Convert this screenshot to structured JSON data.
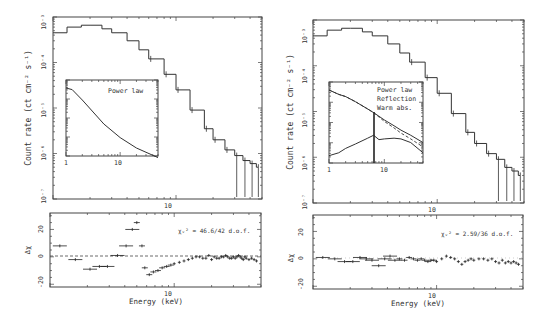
{
  "chart_data": [
    {
      "panel": "left",
      "type": "line",
      "subtype": "step-spectrum",
      "title": "",
      "xlabel": "Energy (keV)",
      "ylabel": "Count rate (ct cm^-2 s^-1)",
      "xscale": "log",
      "yscale": "log",
      "xlim": [
        1,
        50
      ],
      "ylim": [
        1e-07,
        0.001
      ],
      "x_ticks": [
        "10"
      ],
      "y_ticks": [
        "10^-7",
        "10^-6",
        "10^-5",
        "10^-4",
        "10^-3"
      ],
      "series": [
        {
          "name": "Data + model",
          "x": [
            1.0,
            1.3,
            1.7,
            2.0,
            2.5,
            3.0,
            4.0,
            5.0,
            6.0,
            8.0,
            10,
            13,
            17,
            20,
            25,
            30,
            35,
            40,
            45
          ],
          "y": [
            0.00045,
            0.0006,
            0.00066,
            0.00066,
            0.00055,
            0.00045,
            0.0003,
            0.00019,
            0.00012,
            5.5e-05,
            2.5e-05,
            9e-06,
            3.5e-06,
            2e-06,
            1.2e-06,
            9e-07,
            7e-07,
            6e-07,
            5e-07
          ]
        }
      ],
      "inset": {
        "label": "Power law",
        "xlim": [
          1,
          50
        ],
        "x_ticks": [
          "1",
          "10"
        ],
        "series": [
          {
            "name": "Power law",
            "x": [
              1,
              1.3,
              2,
              5,
              10,
              20,
              50
            ],
            "y": [
              1.0,
              0.98,
              0.85,
              0.55,
              0.38,
              0.25,
              0.13
            ]
          }
        ]
      },
      "residuals": {
        "ylabel": "Δχ",
        "ylim": [
          -22,
          32
        ],
        "y_ticks": [
          "-20",
          "0",
          "20"
        ],
        "x_ticks": [
          "10"
        ],
        "annotation": "χ_ν² = 46.6/42 d.o.f.",
        "x": [
          1.2,
          1.6,
          2.1,
          2.5,
          2.9,
          3.5,
          4.1,
          4.6,
          5.0,
          5.5,
          5.8,
          6.3,
          6.8,
          7.4,
          8.0,
          8.7,
          9.4,
          10,
          11,
          12,
          13,
          14,
          15,
          16,
          17,
          18,
          19,
          20,
          21,
          22,
          23,
          24,
          25,
          26,
          27,
          28,
          29,
          30,
          31,
          32,
          33,
          34,
          35,
          36,
          37,
          38,
          40,
          42,
          44,
          46
        ],
        "values": [
          8,
          -2,
          -9,
          -7,
          -7,
          1,
          8,
          20,
          25,
          8,
          -8,
          -13,
          -11,
          -10,
          -8,
          -7,
          -6,
          -5,
          -4,
          -3,
          -2,
          -1,
          0,
          0,
          -1,
          -1,
          1,
          -2,
          0,
          -1,
          -1,
          0,
          0,
          1,
          0,
          -1,
          -1,
          0,
          -1,
          0,
          1,
          0,
          -1,
          -2,
          0,
          -1,
          -2,
          -1,
          -2,
          -3
        ]
      }
    },
    {
      "panel": "right",
      "type": "line",
      "subtype": "step-spectrum",
      "title": "",
      "xlabel": "Energy (keV)",
      "ylabel": "Count rate (ct cm^-2 s^-1)",
      "xscale": "log",
      "yscale": "log",
      "xlim": [
        1,
        50
      ],
      "ylim": [
        1e-07,
        0.001
      ],
      "x_ticks": [
        "10"
      ],
      "y_ticks": [
        "10^-7",
        "10^-6",
        "10^-5",
        "10^-4",
        "10^-3"
      ],
      "series": [
        {
          "name": "Data + model",
          "x": [
            1.0,
            1.3,
            1.7,
            2.0,
            2.5,
            3.0,
            4.0,
            5.0,
            6.0,
            8.0,
            10,
            13,
            17,
            20,
            25,
            30,
            35,
            40,
            45
          ],
          "y": [
            0.00045,
            0.0006,
            0.00066,
            0.00066,
            0.00055,
            0.00045,
            0.0003,
            0.00019,
            0.00012,
            5.5e-05,
            2.5e-05,
            9e-06,
            3.5e-06,
            2e-06,
            1.2e-06,
            9e-07,
            6e-07,
            5e-07,
            4e-07
          ]
        }
      ],
      "inset": {
        "labels": [
          "Power law",
          "Reflection",
          "Warm abs."
        ],
        "xlim": [
          1,
          50
        ],
        "x_ticks": [
          "1",
          "10"
        ],
        "series": [
          {
            "name": "Power law",
            "style": "solid"
          },
          {
            "name": "Reflection",
            "style": "solid, with Fe line at ~6.4 keV"
          },
          {
            "name": "Warm abs.",
            "style": "dashed"
          }
        ]
      },
      "residuals": {
        "ylabel": "Δχ",
        "ylim": [
          -22,
          32
        ],
        "y_ticks": [
          "-20",
          "0",
          "20"
        ],
        "x_ticks": [
          "10"
        ],
        "annotation": "χ_ν² = 2.59/36 d.o.f.",
        "x": [
          1.2,
          1.5,
          1.8,
          2.1,
          2.4,
          2.7,
          3.0,
          3.4,
          3.8,
          4.2,
          4.6,
          5.0,
          5.5,
          6.0,
          6.5,
          7.0,
          7.5,
          8.0,
          8.5,
          9.0,
          9.5,
          10,
          11,
          12,
          13,
          14,
          15,
          16,
          17,
          18,
          19,
          20,
          22,
          24,
          26,
          28,
          30,
          32,
          34,
          36,
          38,
          40,
          42,
          44,
          46
        ],
        "values": [
          1,
          0,
          -2,
          -2,
          1,
          0,
          -1,
          -5,
          0,
          2,
          -1,
          0,
          -1,
          1,
          0,
          -1,
          0,
          -1,
          -2,
          -1,
          -1,
          -2,
          0,
          2,
          1,
          0,
          -2,
          -4,
          -2,
          -1,
          0,
          -1,
          0,
          0,
          -1,
          0,
          -2,
          -3,
          -1,
          -3,
          -2,
          -3,
          -2,
          -3,
          -4
        ]
      }
    }
  ],
  "left": {
    "ylabel": "Count rate (ct cm⁻² s⁻¹)",
    "yticks": [
      "10⁻³",
      "10⁻⁴",
      "10⁻⁵",
      "10⁻⁶",
      "10⁻⁷"
    ],
    "xtick_main": "10",
    "inset_label": "Power law",
    "inset_xtick_1": "1",
    "inset_xtick_10": "10",
    "res_ylabel": "Δχ",
    "res_yticks": [
      "20",
      "0",
      "-20"
    ],
    "res_xtick": "10",
    "chi_text": "χᵥ² = 46.6/42 d.o.f.",
    "xlabel": "Energy (keV)"
  },
  "right": {
    "ylabel": "Count rate (ct cm⁻² s⁻¹)",
    "yticks": [
      "10⁻³",
      "10⁻⁴",
      "10⁻⁵",
      "10⁻⁶",
      "10⁻⁷"
    ],
    "xtick_main": "10",
    "inset_labels": [
      "Power law",
      "Reflection",
      "Warm abs."
    ],
    "inset_xtick_1": "1",
    "inset_xtick_10": "10",
    "res_ylabel": "Δχ",
    "res_yticks": [
      "20",
      "0",
      "-20"
    ],
    "res_xtick": "10",
    "chi_text": "χᵥ² = 2.59/36 d.o.f.",
    "xlabel": "Energy (keV)"
  },
  "colors": {
    "ink": "#333333",
    "background": "#ffffff"
  }
}
